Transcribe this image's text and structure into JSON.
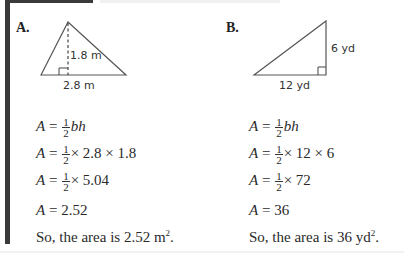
{
  "problems": [
    {
      "label": "A.",
      "figure": {
        "shape": "triangle",
        "height_label": "1.8 m",
        "base_label": "2.8 m"
      },
      "steps": [
        {
          "lhs": "A",
          "fraction": {
            "num": "1",
            "den": "2"
          },
          "rhs": "bh"
        },
        {
          "lhs": "A",
          "fraction": {
            "num": "1",
            "den": "2"
          },
          "rhs": "× 2.8 × 1.8"
        },
        {
          "lhs": "A",
          "fraction": {
            "num": "1",
            "den": "2"
          },
          "rhs": "× 5.04"
        },
        {
          "lhs": "A",
          "rhs": "2.52"
        }
      ],
      "conclusion": {
        "text": "So, the area is 2.52 m",
        "sup": "2",
        "end": "."
      }
    },
    {
      "label": "B.",
      "figure": {
        "shape": "right-triangle",
        "height_label": "6 yd",
        "base_label": "12 yd"
      },
      "steps": [
        {
          "lhs": "A",
          "fraction": {
            "num": "1",
            "den": "2"
          },
          "rhs": "bh"
        },
        {
          "lhs": "A",
          "fraction": {
            "num": "1",
            "den": "2"
          },
          "rhs": "× 12 × 6"
        },
        {
          "lhs": "A",
          "fraction": {
            "num": "1",
            "den": "2"
          },
          "rhs": "× 72"
        },
        {
          "lhs": "A",
          "rhs": "36"
        }
      ],
      "conclusion": {
        "text": "So, the area is 36 yd",
        "sup": "2",
        "end": "."
      }
    }
  ],
  "symbols": {
    "equals": "="
  }
}
